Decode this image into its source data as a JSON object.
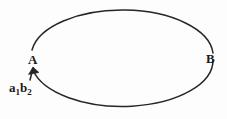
{
  "figure": {
    "type": "ellipse-diagram",
    "background_color": "#fdfdfd",
    "stroke_color": "#262626",
    "text_color": "#1a1a1a",
    "width": 227,
    "height": 119,
    "labels": {
      "point_a": "A",
      "point_b": "B",
      "annotation_base": "a",
      "annotation_sub1": "1",
      "annotation_base2": "b",
      "annotation_sub2": "2",
      "annotation_full": "a1b2"
    },
    "geometry": {
      "ellipse_center_x": 122,
      "ellipse_center_y": 56,
      "ellipse_radius_x": 91,
      "ellipse_radius_y": 46,
      "gap_start_deg": 168,
      "gap_end_deg": 192,
      "point_a_x": 31,
      "point_a_y": 56,
      "point_b_x": 213,
      "point_b_y": 56,
      "arrow_tail_x": 31,
      "arrow_tail_y": 80,
      "arrow_tip_x": 33,
      "arrow_tip_y": 67
    }
  }
}
